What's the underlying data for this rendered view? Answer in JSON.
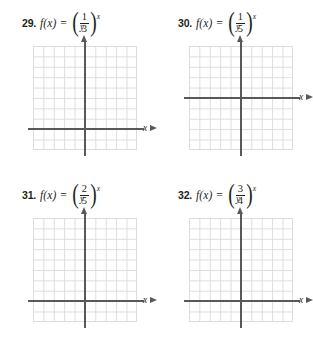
{
  "page": {
    "kind": "math-worksheet-exercises",
    "background_color": "#ffffff",
    "axis_color": "#58595b",
    "grid_color": "#dcdcdc",
    "text_color": "#231f20"
  },
  "problems": [
    {
      "number": "29.",
      "function_name": "f(x)",
      "equals": "=",
      "open_paren": "(",
      "close_paren": ")",
      "numerator": "1",
      "denominator": "3",
      "exponent": "x",
      "graph": {
        "x_axis_label": "x",
        "y_axis_label": "y",
        "columns": 10,
        "rows": 10,
        "cell_px": 10.4,
        "origin_col": 5,
        "origin_row": 8
      }
    },
    {
      "number": "30.",
      "function_name": "f(x)",
      "equals": "=",
      "open_paren": "(",
      "close_paren": ")",
      "numerator": "1",
      "denominator": "5",
      "exponent": "x",
      "graph": {
        "x_axis_label": "x",
        "y_axis_label": "y",
        "columns": 10,
        "rows": 10,
        "cell_px": 10.4,
        "origin_col": 5,
        "origin_row": 5
      }
    },
    {
      "number": "31.",
      "function_name": "f(x)",
      "equals": "=",
      "open_paren": "(",
      "close_paren": ")",
      "numerator": "2",
      "denominator": "5",
      "exponent": "x",
      "graph": {
        "x_axis_label": "x",
        "y_axis_label": "y",
        "columns": 10,
        "rows": 10,
        "cell_px": 10.4,
        "origin_col": 5,
        "origin_row": 8
      }
    },
    {
      "number": "32.",
      "function_name": "f(x)",
      "equals": "=",
      "open_paren": "(",
      "close_paren": ")",
      "numerator": "3",
      "denominator": "4",
      "exponent": "x",
      "graph": {
        "x_axis_label": "x",
        "y_axis_label": "y",
        "columns": 10,
        "rows": 10,
        "cell_px": 10.4,
        "origin_col": 5,
        "origin_row": 8
      }
    }
  ]
}
